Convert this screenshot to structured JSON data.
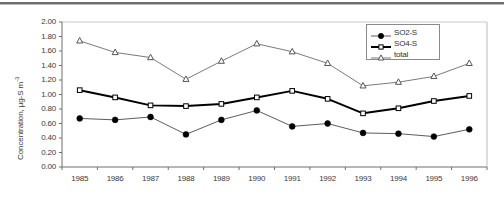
{
  "chart_data": {
    "type": "line",
    "title": "",
    "xlabel": "",
    "ylabel": "Concentration, µg-S m",
    "ylabel_exponent": "-3",
    "ylim": [
      0.0,
      2.0
    ],
    "ytick_step": 0.2,
    "ytick_labels": [
      "2.00",
      "1.80",
      "1.60",
      "1.40",
      "1.20",
      "1.00",
      "0.80",
      "0.60",
      "0.40",
      "0.20",
      "0.00"
    ],
    "grid": false,
    "legend_position": "top-right",
    "categories": [
      "1985",
      "1986",
      "1987",
      "1988",
      "1989",
      "1990",
      "1991",
      "1992",
      "1993",
      "1994",
      "1995",
      "1996"
    ],
    "series": [
      {
        "name": "SO2-S",
        "marker": "filled-circle",
        "line": "thin",
        "values": [
          0.67,
          0.65,
          0.69,
          0.45,
          0.65,
          0.78,
          0.56,
          0.6,
          0.47,
          0.46,
          0.42,
          0.52
        ]
      },
      {
        "name": "SO4-S",
        "marker": "open-square",
        "line": "thick",
        "values": [
          1.06,
          0.96,
          0.85,
          0.84,
          0.87,
          0.96,
          1.05,
          0.94,
          0.74,
          0.81,
          0.91,
          0.98
        ]
      },
      {
        "name": "total",
        "marker": "open-triangle",
        "line": "thin",
        "values": [
          1.74,
          1.58,
          1.51,
          1.21,
          1.46,
          1.7,
          1.59,
          1.43,
          1.12,
          1.17,
          1.25,
          1.43
        ]
      }
    ]
  },
  "legend": {
    "items": [
      {
        "label": "SO2-S",
        "marker": "filled-circle"
      },
      {
        "label": "SO4-S",
        "marker": "open-square"
      },
      {
        "label": "total",
        "marker": "open-triangle"
      }
    ]
  }
}
